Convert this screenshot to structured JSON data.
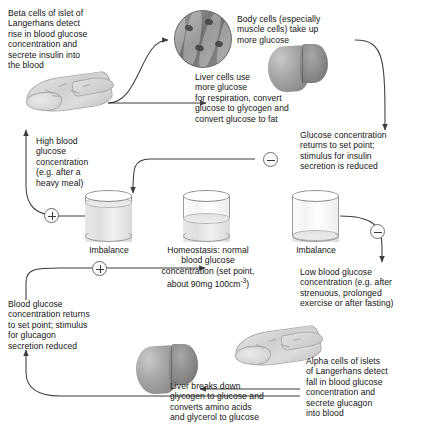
{
  "diagram": {
    "type": "biology-flow-diagram"
  },
  "nodes": {
    "beta_cells": "Beta cells of islet of\nLangerhans detect\nrise in blood glucose\nconcentration and\nsecrete insulin into\nthe blood",
    "body_cells": "Body cells (especially\nmuscle cells) take up\nmore glucose",
    "liver_uptake": "Liver cells use\nmore glucose\nfor respiration, convert\nglucose to glycogen and\nconvert glucose to fat",
    "insulin_reduced": "Glucose concentration\nreturns to set point;\nstimulus for insulin\nsecretion is reduced",
    "high_glucose": "High blood\nglucose\nconcentration\n(e.g. after a\nheavy meal)",
    "homeostasis": "Homeostasis: normal\nblood glucose\nconcentration (set point,",
    "homeostasis_value": "about 90mg 100cm",
    "homeostasis_exponent": "-3",
    "homeostasis_close": ")",
    "low_glucose": "Low blood glucose\nconcentration (e.g. after\nstrenuous, prolonged\nexercise or after fasting)",
    "alpha_cells": "Alpha cells of islets\nof Langerhans detect\nfall in blood glucose\nconcentration and\nsecrete glucagon\ninto blood",
    "liver_breakdown": "Liver breaks down\nglycogen to glucose and\nconverts amino acids\nand glycerol to glucose",
    "glucagon_reduced": "Blood glucose\nconcentration returns\nto set point; stimulus\nfor glucagon\nsecretion reduced"
  },
  "labels": {
    "imbalance_left": "Imbalance",
    "imbalance_right": "Imbalance"
  },
  "signs": {
    "plus_high": "+",
    "minus_insulin": "−",
    "minus_low": "−",
    "plus_low": "+"
  },
  "gauges": [
    {
      "name": "high-glucose-gauge",
      "fill_percent": 88,
      "state": "Imbalance"
    },
    {
      "name": "homeostasis-gauge",
      "fill_percent": 52,
      "state": "Homeostasis"
    },
    {
      "name": "low-glucose-gauge",
      "fill_percent": 14,
      "state": "Imbalance"
    }
  ],
  "colors": {
    "ink": "#141414",
    "line": "#4a4a4a",
    "organ_dark": "#7e7e7e",
    "organ_light": "#d8d8d8"
  }
}
